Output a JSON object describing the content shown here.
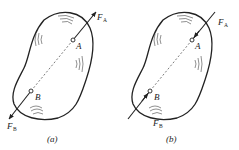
{
  "figure": {
    "panels": [
      {
        "id": "a",
        "caption": "(a)",
        "point_A": "A",
        "point_B": "B",
        "force_A": {
          "symbol": "F",
          "subscript": "A",
          "direction": "outward (tension)"
        },
        "force_B": {
          "symbol": "F",
          "subscript": "B",
          "direction": "outward (tension)"
        }
      },
      {
        "id": "b",
        "caption": "(b)",
        "point_A": "A",
        "point_B": "B",
        "force_A": {
          "symbol": "F",
          "subscript": "A",
          "direction": "inward (compression)"
        },
        "force_B": {
          "symbol": "F",
          "subscript": "B",
          "direction": "inward (compression)"
        }
      }
    ],
    "colors": {
      "stroke": "#222222",
      "background": "#ffffff"
    }
  }
}
